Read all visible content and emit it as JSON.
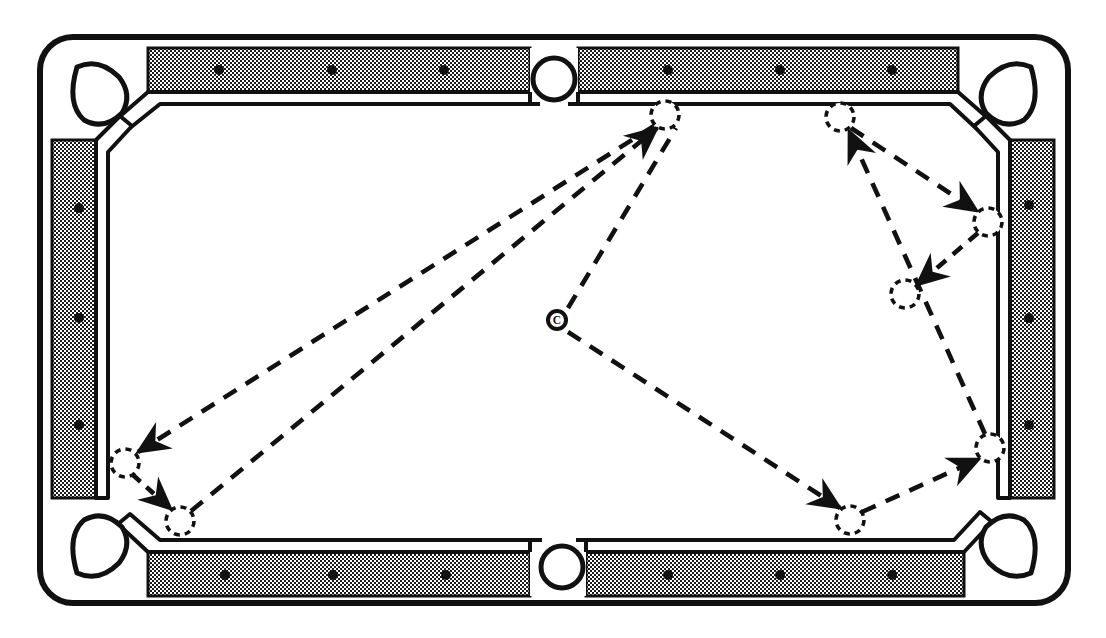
{
  "diagram": {
    "canvas": {
      "width": 1106,
      "height": 638
    },
    "colors": {
      "ink": "#111111",
      "rail_fill": "#b8b8b8",
      "cloth": "#ffffff",
      "page": "#ffffff",
      "diamond": "#111111"
    }
  },
  "table": {
    "name": "pool-table",
    "outer_frame": {
      "x": 38,
      "y": 35,
      "width": 1032,
      "height": 570,
      "corner_radius": 34
    },
    "rail_band": {
      "x": 66,
      "y": 60,
      "width": 976,
      "height": 520
    },
    "cloth_area": {
      "x": 108,
      "y": 100,
      "width": 892,
      "height": 440
    },
    "cushion_nose": {
      "x": 108,
      "y": 100,
      "width": 892,
      "height": 440
    },
    "rail_width": 42,
    "orientation": "landscape"
  },
  "pockets": [
    {
      "id": "top-left",
      "name": "corner-pocket-top-left",
      "type": "corner",
      "cx": 98,
      "cy": 88,
      "r": 27
    },
    {
      "id": "top-side",
      "name": "side-pocket-top",
      "type": "side",
      "cx": 554,
      "cy": 75,
      "r": 21
    },
    {
      "id": "top-right",
      "name": "corner-pocket-top-right",
      "type": "corner",
      "cx": 1010,
      "cy": 88,
      "r": 27
    },
    {
      "id": "bottom-left",
      "name": "corner-pocket-bottom-left",
      "type": "corner",
      "cx": 98,
      "cy": 552,
      "r": 27
    },
    {
      "id": "bottom-side",
      "name": "side-pocket-bottom",
      "type": "side",
      "cx": 562,
      "cy": 563,
      "r": 21
    },
    {
      "id": "bottom-right",
      "name": "corner-pocket-bottom-right",
      "type": "corner",
      "cx": 1010,
      "cy": 552,
      "r": 27
    }
  ],
  "diamonds": {
    "count": 18,
    "radius": 5,
    "top": [
      {
        "x": 219,
        "y": 70
      },
      {
        "x": 332,
        "y": 70
      },
      {
        "x": 444,
        "y": 70
      },
      {
        "x": 668,
        "y": 70
      },
      {
        "x": 780,
        "y": 70
      },
      {
        "x": 892,
        "y": 70
      }
    ],
    "bottom": [
      {
        "x": 225,
        "y": 575
      },
      {
        "x": 333,
        "y": 575
      },
      {
        "x": 446,
        "y": 575
      },
      {
        "x": 668,
        "y": 575
      },
      {
        "x": 780,
        "y": 575
      },
      {
        "x": 892,
        "y": 575
      }
    ],
    "left": [
      {
        "x": 79,
        "y": 208
      },
      {
        "x": 79,
        "y": 318
      },
      {
        "x": 79,
        "y": 425
      }
    ],
    "right": [
      {
        "x": 1029,
        "y": 205
      },
      {
        "x": 1029,
        "y": 318
      },
      {
        "x": 1029,
        "y": 425
      }
    ]
  },
  "cue_ball": {
    "name": "cue-ball",
    "label": "C",
    "x": 557,
    "y": 320,
    "outer_radius": 11,
    "inner_radius": 7
  },
  "object_balls": [
    {
      "id": "b1",
      "name": "object-ball-top-left-rail",
      "x": 665,
      "y": 115,
      "r": 14
    },
    {
      "id": "b2",
      "name": "object-ball-top-right-rail",
      "x": 840,
      "y": 117,
      "r": 14
    },
    {
      "id": "b3",
      "name": "object-ball-right-rail",
      "x": 988,
      "y": 222,
      "r": 14
    },
    {
      "id": "b4",
      "name": "object-ball-right-mid",
      "x": 905,
      "y": 294,
      "r": 14
    },
    {
      "id": "b5",
      "name": "object-ball-lower-left-upper",
      "x": 125,
      "y": 463,
      "r": 14
    },
    {
      "id": "b6",
      "name": "object-ball-lower-left-lower",
      "x": 180,
      "y": 521,
      "r": 14
    },
    {
      "id": "b7",
      "name": "object-ball-bottom-mid",
      "x": 850,
      "y": 520,
      "r": 14
    },
    {
      "id": "b8",
      "name": "object-ball-bottom-right-rail",
      "x": 990,
      "y": 448,
      "r": 14
    }
  ],
  "shot_paths": [
    {
      "id": "p1",
      "name": "path-cue-to-top-left-ball",
      "from": {
        "x": 568,
        "y": 308
      },
      "to": {
        "x": 676,
        "y": 128
      },
      "arrow": "none",
      "label": "cue ball toward upper area"
    },
    {
      "id": "p2",
      "name": "path-top-left-ball-to-lower-left",
      "from": {
        "x": 654,
        "y": 126
      },
      "to": {
        "x": 138,
        "y": 452
      },
      "arrow": "end",
      "label": "long diagonal to lower-left ball"
    },
    {
      "id": "p3",
      "name": "path-lower-left-short-hop",
      "from": {
        "x": 133,
        "y": 475
      },
      "to": {
        "x": 171,
        "y": 509
      },
      "arrow": "end",
      "label": "short hop between lower-left balls"
    },
    {
      "id": "p4",
      "name": "path-lower-left-to-top-left-ball",
      "from": {
        "x": 191,
        "y": 511
      },
      "to": {
        "x": 657,
        "y": 128
      },
      "arrow": "end",
      "label": "return diagonal up to top-left ball"
    },
    {
      "id": "p5",
      "name": "path-cue-to-bottom-mid",
      "from": {
        "x": 568,
        "y": 332
      },
      "to": {
        "x": 840,
        "y": 508
      },
      "arrow": "end",
      "label": "cue ball down-right to bottom-mid ball"
    },
    {
      "id": "p6",
      "name": "path-bottom-mid-to-bottom-right",
      "from": {
        "x": 862,
        "y": 512
      },
      "to": {
        "x": 979,
        "y": 459
      },
      "arrow": "end",
      "label": "bottom-mid to bottom-right rail ball"
    },
    {
      "id": "p7",
      "name": "path-bottom-right-to-top-right",
      "from": {
        "x": 985,
        "y": 434
      },
      "to": {
        "x": 849,
        "y": 131
      },
      "arrow": "end",
      "label": "up the right side to top-right ball"
    },
    {
      "id": "p8",
      "name": "path-top-right-to-right-rail",
      "from": {
        "x": 851,
        "y": 128
      },
      "to": {
        "x": 977,
        "y": 211
      },
      "arrow": "end",
      "label": "top-right ball to right-rail ball"
    },
    {
      "id": "p9",
      "name": "path-right-rail-to-right-mid",
      "from": {
        "x": 978,
        "y": 233
      },
      "to": {
        "x": 917,
        "y": 285
      },
      "arrow": "end",
      "label": "right-rail ball to right-mid ball"
    }
  ],
  "legend": {
    "cue_ball_marker": "C",
    "object_ball_marker": "dashed-circle",
    "path_style": "dashed-line-with-arrowhead"
  }
}
